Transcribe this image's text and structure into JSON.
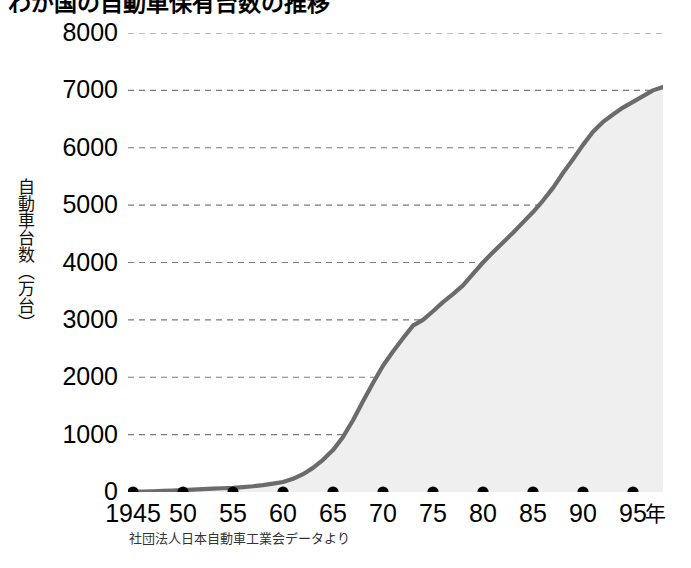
{
  "title": "わが国の自動車保有台数の推移",
  "y_axis_caption": "自動車台数（万台）",
  "source_note": "社団法人日本自動車工業会データより",
  "axis": {
    "x_unit_label": "年",
    "y_ticks": [
      "8000",
      "7000",
      "6000",
      "5000",
      "4000",
      "3000",
      "2000",
      "1000",
      "0"
    ],
    "x_ticks": [
      "1945",
      "50",
      "55",
      "60",
      "65",
      "70",
      "75",
      "80",
      "85",
      "90",
      "95"
    ]
  },
  "colors": {
    "line": "#6b6b6b",
    "area_fill": "#efefef",
    "gridline": "#7a7a7a",
    "marker": "#000000",
    "text": "#000000",
    "background": "#ffffff"
  },
  "chart_data": {
    "type": "area",
    "title": "わが国の自動車保有台数の推移",
    "xlabel": "年",
    "ylabel": "自動車台数（万台）",
    "xlim": [
      1945,
      1998
    ],
    "ylim": [
      0,
      8000
    ],
    "grid": true,
    "legend": "none",
    "y_tick_values": [
      0,
      1000,
      2000,
      3000,
      4000,
      5000,
      6000,
      7000,
      8000
    ],
    "x_tick_values": [
      1945,
      1950,
      1955,
      1960,
      1965,
      1970,
      1975,
      1980,
      1985,
      1990,
      1995
    ],
    "marker_points_on_baseline": [
      1945,
      1950,
      1955,
      1960,
      1965,
      1970,
      1975,
      1980,
      1985,
      1990,
      1995
    ],
    "series": [
      {
        "name": "自動車保有台数（万台）",
        "x": [
          1945,
          1946,
          1947,
          1948,
          1949,
          1950,
          1951,
          1952,
          1953,
          1954,
          1955,
          1956,
          1957,
          1958,
          1959,
          1960,
          1961,
          1962,
          1963,
          1964,
          1965,
          1966,
          1967,
          1968,
          1969,
          1970,
          1971,
          1972,
          1973,
          1974,
          1975,
          1976,
          1977,
          1978,
          1979,
          1980,
          1981,
          1982,
          1983,
          1984,
          1985,
          1986,
          1987,
          1988,
          1989,
          1990,
          1991,
          1992,
          1993,
          1994,
          1995,
          1996,
          1997,
          1998
        ],
        "values": [
          5,
          8,
          12,
          18,
          25,
          35,
          42,
          50,
          58,
          65,
          72,
          85,
          100,
          120,
          145,
          175,
          230,
          310,
          420,
          560,
          730,
          960,
          1250,
          1580,
          1900,
          2200,
          2450,
          2680,
          2900,
          3000,
          3150,
          3310,
          3450,
          3600,
          3800,
          4000,
          4180,
          4350,
          4520,
          4700,
          4880,
          5080,
          5300,
          5560,
          5800,
          6050,
          6280,
          6450,
          6580,
          6700,
          6800,
          6900,
          7000,
          7060
        ]
      }
    ],
    "annotations": {
      "source": "社団法人日本自動車工業会データより"
    }
  }
}
